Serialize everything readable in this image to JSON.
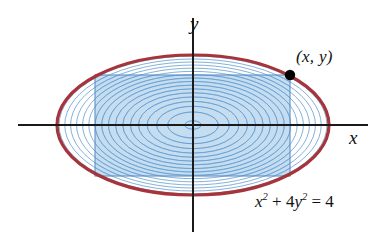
{
  "figure": {
    "labels": {
      "y_axis": "y",
      "x_axis": "x",
      "point": "(x, y)",
      "equation_base_x": "x",
      "equation_exp_x": "2",
      "equation_mid": " + 4",
      "equation_base_y": "y",
      "equation_exp_y": "2",
      "equation_tail": " = 4"
    },
    "colors": {
      "ellipse_stroke": "#a6343a",
      "rect_fill": "#9cc6e8",
      "rect_stroke": "#5b8fc9",
      "contour_stroke": "#6fa3d2",
      "axis": "#1a1a1a",
      "point_marker": "#000000",
      "background": "#ffffff"
    }
  },
  "chart_data": {
    "type": "line",
    "xlabel": "x",
    "ylabel": "y",
    "xlim": [
      -2.75,
      2.6
    ],
    "ylim": [
      -1.55,
      1.5
    ],
    "grid": false,
    "legend": null,
    "annotations": [
      {
        "text": "(x, y)",
        "x": 1.41,
        "y": 0.707,
        "note": "point on ellipse at rectangle corner"
      },
      {
        "text": "x^2 + 4y^2 = 4",
        "x": 1.3,
        "y": -1.15,
        "note": "ellipse equation label"
      }
    ],
    "series": [
      {
        "name": "boundary ellipse",
        "kind": "ellipse",
        "center": [
          0,
          0
        ],
        "semi_axis_x": 2.0,
        "semi_axis_y": 1.0,
        "stroke": "#a6343a",
        "stroke_width": 3.2,
        "fill": "none"
      },
      {
        "name": "inscribed rectangle",
        "kind": "rect",
        "x_half_width": 1.41,
        "y_half_height": 0.707,
        "corners": [
          [
            1.41,
            0.707
          ],
          [
            -1.41,
            0.707
          ],
          [
            -1.41,
            -0.707
          ],
          [
            1.41,
            -0.707
          ]
        ],
        "fill": "#9cc6e8",
        "fill_opacity": 0.62,
        "stroke": "#5b8fc9",
        "stroke_width": 1.1
      },
      {
        "name": "interior concentric ellipses",
        "kind": "ellipse-family",
        "count": 17,
        "center": [
          0,
          0
        ],
        "scale_min": 0.06,
        "scale_max": 0.985,
        "stroke": "#6fa3d2",
        "stroke_width": 0.85,
        "fill": "none"
      },
      {
        "name": "marked point",
        "kind": "point",
        "x": 1.41,
        "y": 0.707,
        "marker": "filled-circle",
        "radius_px": 5,
        "color": "#000000"
      }
    ],
    "axes": {
      "x_axis_span": [
        -2.75,
        2.6
      ],
      "y_axis_span": [
        -1.52,
        1.5
      ],
      "arrowheads": false,
      "ticks": []
    }
  }
}
